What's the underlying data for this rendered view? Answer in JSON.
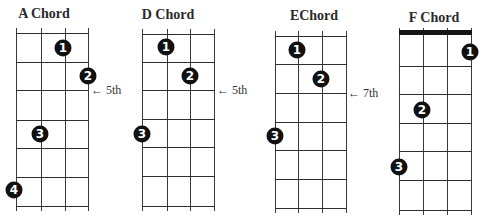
{
  "diagram": {
    "type": "guitar-chord-charts",
    "chords": [
      {
        "name": "A Chord",
        "title_x": 44,
        "title_y": 15,
        "strings_x": [
          16,
          41,
          65,
          88
        ],
        "frets_y": [
          33,
          62,
          90,
          120,
          148,
          177,
          206
        ],
        "nut": false,
        "dots": [
          {
            "finger": "1",
            "x": 63,
            "y": 48
          },
          {
            "finger": "2",
            "x": 88,
            "y": 76
          },
          {
            "finger": "3",
            "x": 40,
            "y": 134
          },
          {
            "finger": "4",
            "x": 14,
            "y": 190
          }
        ],
        "marker": {
          "text": "← 5th",
          "x": 91,
          "y": 90
        }
      },
      {
        "name": "D Chord",
        "title_x": 168,
        "title_y": 16,
        "strings_x": [
          142,
          167,
          190,
          214
        ],
        "frets_y": [
          34,
          62,
          90,
          119,
          147,
          176,
          206
        ],
        "nut": false,
        "dots": [
          {
            "finger": "1",
            "x": 166,
            "y": 47
          },
          {
            "finger": "2",
            "x": 190,
            "y": 76
          },
          {
            "finger": "3",
            "x": 142,
            "y": 134
          }
        ],
        "marker": {
          "text": "← 5th",
          "x": 217,
          "y": 90
        }
      },
      {
        "name": "EChord",
        "title_x": 314,
        "title_y": 17,
        "strings_x": [
          275,
          298,
          322,
          346
        ],
        "frets_y": [
          36,
          64,
          93,
          122,
          150,
          179,
          208
        ],
        "nut": false,
        "dots": [
          {
            "finger": "1",
            "x": 297,
            "y": 50
          },
          {
            "finger": "2",
            "x": 321,
            "y": 79
          },
          {
            "finger": "3",
            "x": 275,
            "y": 136
          }
        ],
        "marker": {
          "text": "← 7th",
          "x": 348,
          "y": 93
        }
      },
      {
        "name": "F Chord",
        "title_x": 434,
        "title_y": 19,
        "strings_x": [
          399,
          423,
          447,
          471
        ],
        "frets_y": [
          33,
          66,
          94,
          123,
          151,
          180,
          210
        ],
        "nut": true,
        "dots": [
          {
            "finger": "1",
            "x": 470,
            "y": 52
          },
          {
            "finger": "2",
            "x": 422,
            "y": 110
          },
          {
            "finger": "3",
            "x": 399,
            "y": 167
          }
        ],
        "marker": null
      }
    ],
    "colors": {
      "background": "#ffffff",
      "dot": "#111111",
      "dot_text": "#ffffff",
      "grid": "#333333",
      "nut": "#151515"
    }
  }
}
